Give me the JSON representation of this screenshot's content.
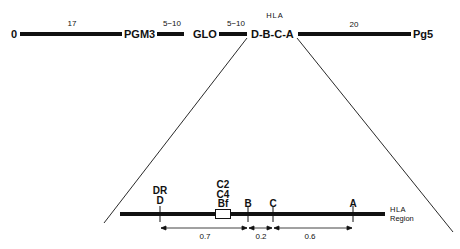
{
  "diagram": {
    "type": "genetic-map",
    "top_map": {
      "markers": [
        "0",
        "PGM3",
        "GLO",
        "D-B-C-A",
        "Pg5"
      ],
      "distances": [
        "17",
        "5−10",
        "5−10",
        "20"
      ],
      "region_label": "HLA"
    },
    "expanded_region": {
      "loci": {
        "dr_label": "DR",
        "d_label": "D",
        "c2_label": "C2",
        "c4_label": "C4",
        "bf_label": "Bf",
        "b_label": "B",
        "c_label": "C",
        "a_label": "A"
      },
      "distances": [
        "0.7",
        "0.2",
        "0.6"
      ],
      "region_label_line1": "HLA",
      "region_label_line2": "Region"
    }
  }
}
